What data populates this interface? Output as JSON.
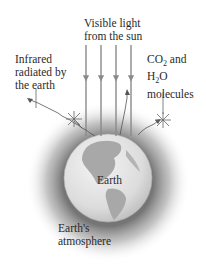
{
  "labels": {
    "visible_light": [
      "Visible light",
      "from the sun"
    ],
    "infrared": [
      "Infrared",
      "radiated by",
      "the earth"
    ],
    "molecules": {
      "line1_prefix": "CO",
      "line1_sub": "2",
      "line1_suffix": " and",
      "line2_prefix": "H",
      "line2_sub": "2",
      "line2_suffix": "O",
      "line3": "molecules"
    },
    "earth": "Earth",
    "atmosphere": [
      "Earth's",
      "atmosphere"
    ]
  },
  "colors": {
    "arrow": "#8a8a8a",
    "globe_ocean": "#e6e6e6",
    "globe_land": "#a5a5a5",
    "atmosphere": "#9a9a9a"
  }
}
